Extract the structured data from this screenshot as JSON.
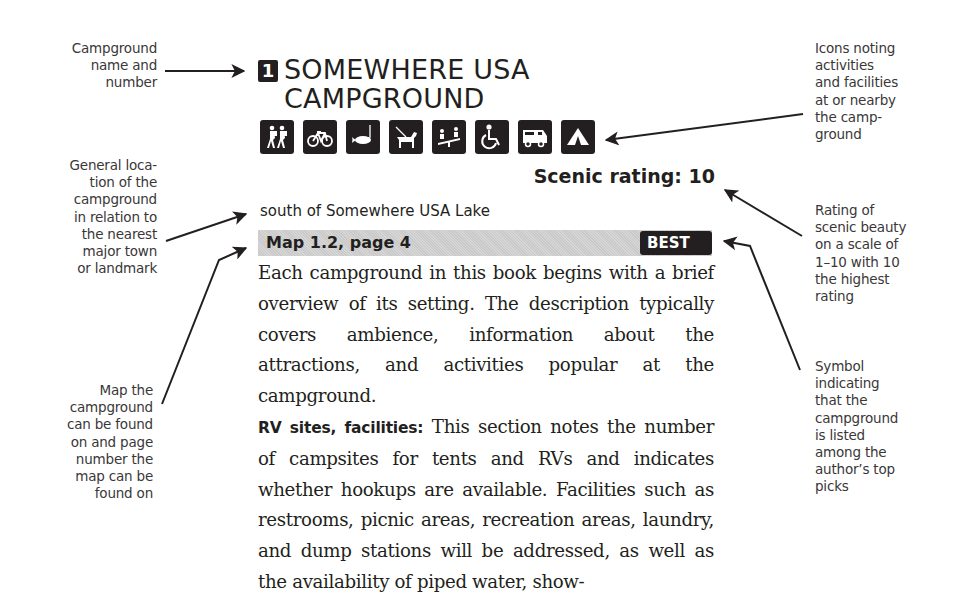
{
  "entry": {
    "number": "1",
    "title_line1": "SOMEWHERE USA",
    "title_line2": "CAMPGROUND",
    "icons": [
      "hiking-icon",
      "biking-icon",
      "fishing-icon",
      "pets-icon",
      "playground-icon",
      "wheelchair-icon",
      "rv-icon",
      "tent-icon"
    ],
    "scenic_rating": "Scenic rating: 10",
    "location": "south of Somewhere USA Lake",
    "map_ref": "Map 1.2, page 4",
    "best_label": "BEST",
    "paragraph1": "Each campground in this book begins with a brief overview of its setting. The description typically covers ambience, information about the attractions, and activities popular at the campground.",
    "rv_label": "RV sites, facilities:",
    "paragraph2": " This section notes the number of campsites for tents and RVs and indicates whether hookups are available. Facilities such as restrooms, picnic areas, recreation areas, laundry, and dump stations will be addressed, as well as the availability of piped water, show-"
  },
  "callouts": {
    "name": [
      "Campground",
      "name and",
      "number"
    ],
    "location": [
      "General loca-",
      "tion of the",
      "campground",
      "in relation to",
      "the nearest",
      "major town",
      "or landmark"
    ],
    "map": [
      "Map the",
      "campground",
      "can be found",
      "on and page",
      "number the",
      "map can be",
      "found on"
    ],
    "icons": [
      "Icons noting",
      "activities",
      "and facilities",
      "at or nearby",
      "the camp-",
      "ground"
    ],
    "rating": [
      "Rating of",
      "scenic beauty",
      "on a scale of",
      "1–10 with 10",
      "the highest",
      "rating"
    ],
    "best": [
      "Symbol",
      "indicating",
      "that the",
      "campground",
      "is listed",
      "among the",
      "author’s top",
      "picks"
    ]
  },
  "colors": {
    "ink": "#231f20",
    "callout_text": "#3a3738",
    "map_bar": "#cfcfcf"
  }
}
